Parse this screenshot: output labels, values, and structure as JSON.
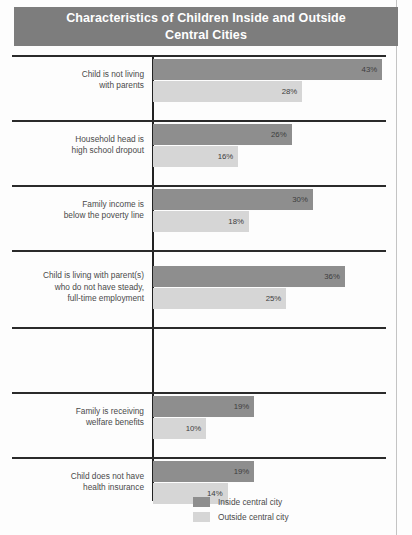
{
  "title": {
    "line1": "Characteristics of Children Inside and Outside",
    "line2": "Central Cities"
  },
  "legend": {
    "inside_label": "Inside central city",
    "outside_label": "Outside central city"
  },
  "colors": {
    "inside": "#8e8e8e",
    "outside": "#d6d6d6",
    "title_banner": "#7d7d7d",
    "axis": "#222222",
    "separator": "#2a2a2a",
    "background": "#fdfdfd"
  },
  "categories": [
    {
      "lines": [
        "Child is not living",
        "with parents"
      ]
    },
    {
      "lines": [
        "Household head is",
        "high school dropout"
      ]
    },
    {
      "lines": [
        "Family income is",
        "below the poverty line"
      ]
    },
    {
      "lines": [
        "Child is living with parent(s)",
        "who do not have steady,",
        "full-time employment"
      ]
    },
    {
      "lines": [
        "Family is receiving",
        "welfare benefits"
      ]
    },
    {
      "lines": [
        "Child does not have",
        "health insurance"
      ]
    }
  ],
  "value_labels": {
    "inside": [
      "43%",
      "26%",
      "30%",
      "36%",
      "19%",
      "19%"
    ],
    "outside": [
      "28%",
      "16%",
      "18%",
      "25%",
      "10%",
      "14%"
    ]
  },
  "chart_data": {
    "type": "bar",
    "orientation": "horizontal",
    "title": "Characteristics of Children Inside and Outside Central Cities",
    "xlabel": "",
    "ylabel": "",
    "xlim": [
      0,
      45
    ],
    "grid": false,
    "legend_position": "bottom-center",
    "categories": [
      "Child is not living with parents",
      "Household head is high school dropout",
      "Family income is below the poverty line",
      "Child is living with parent(s) who do not have steady, full-time employment",
      "Family is receiving welfare benefits",
      "Child does not have health insurance"
    ],
    "series": [
      {
        "name": "Inside central city",
        "values": [
          43,
          26,
          30,
          36,
          19,
          19
        ],
        "color": "#8e8e8e"
      },
      {
        "name": "Outside central city",
        "values": [
          28,
          16,
          18,
          25,
          10,
          14
        ],
        "color": "#d6d6d6"
      }
    ],
    "units": "percent"
  }
}
